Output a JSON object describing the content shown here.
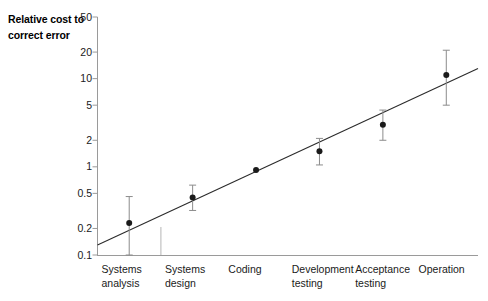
{
  "chart_data": {
    "type": "scatter",
    "title": "",
    "ylabel": "Relative cost to correct error",
    "ylabel_lines": [
      "Relative",
      "cost to",
      "correct error"
    ],
    "xlabel": "",
    "yscale": "log",
    "ylim": [
      0.1,
      50
    ],
    "grid": false,
    "legend": false,
    "ytick_labels": [
      "50",
      "20",
      "10",
      "5",
      "2",
      "1",
      "0.5",
      "0.2",
      "0.1"
    ],
    "ytick_values": [
      50,
      20,
      10,
      5,
      2,
      1,
      0.5,
      0.2,
      0.1
    ],
    "categories": [
      "Systems analysis",
      "Systems design",
      "Coding",
      "Development testing",
      "Acceptance testing",
      "Operation"
    ],
    "category_lines": [
      [
        "Systems",
        "analysis"
      ],
      [
        "Systems",
        "design"
      ],
      [
        "Coding",
        ""
      ],
      [
        "Development",
        "testing"
      ],
      [
        "Acceptance",
        "testing"
      ],
      [
        "Operation",
        ""
      ]
    ],
    "values": [
      0.23,
      0.45,
      0.92,
      1.5,
      3.0,
      11
    ],
    "error_low": [
      0.1,
      0.32,
      0.92,
      1.05,
      2.0,
      5.0
    ],
    "error_high": [
      0.46,
      0.62,
      0.92,
      2.1,
      4.4,
      21
    ],
    "trendline": {
      "x_start": 0,
      "y_start": 0.13,
      "x_end": 6,
      "y_end": 13
    },
    "series": [
      {
        "name": "Relative cost to correct error",
        "points": [
          {
            "category": "Systems analysis",
            "value": 0.23,
            "low": 0.1,
            "high": 0.46
          },
          {
            "category": "Systems design",
            "value": 0.45,
            "low": 0.32,
            "high": 0.62
          },
          {
            "category": "Coding",
            "value": 0.92,
            "low": 0.92,
            "high": 0.92
          },
          {
            "category": "Development testing",
            "value": 1.5,
            "low": 1.05,
            "high": 2.1
          },
          {
            "category": "Acceptance testing",
            "value": 3.0,
            "low": 2.0,
            "high": 4.4
          },
          {
            "category": "Operation",
            "value": 11,
            "low": 5.0,
            "high": 21
          }
        ]
      }
    ],
    "colors": {
      "marker": "#1a1a1a",
      "line": "#2b2b2b",
      "errorbar": "#8c8c8c",
      "axis": "#9a9a9a",
      "background": "#ffffff"
    }
  }
}
